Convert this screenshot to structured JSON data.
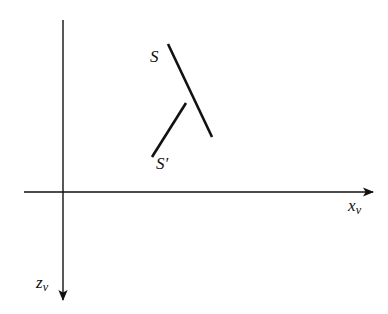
{
  "figure": {
    "background_color": "#ffffff",
    "stroke_color": "#111111",
    "width": 388,
    "height": 314
  },
  "axes": {
    "origin": {
      "x": 63,
      "y": 192
    },
    "horizontal": {
      "name": "x-axis",
      "label_text": "x",
      "label_subscript": "v",
      "start": {
        "x": 24,
        "y": 192
      },
      "end": {
        "x": 373,
        "y": 192
      },
      "arrow": "right",
      "stroke_width": 1.4
    },
    "vertical": {
      "name": "z-axis",
      "label_text": "z",
      "label_subscript": "v",
      "start": {
        "x": 63,
        "y": 20
      },
      "end": {
        "x": 63,
        "y": 300
      },
      "arrow": "down",
      "stroke_width": 1.4
    }
  },
  "segments": [
    {
      "name": "segment-S",
      "label_text": "S",
      "label_prime": "",
      "x1": 168,
      "y1": 44,
      "x2": 212,
      "y2": 137,
      "stroke_width": 2.6
    },
    {
      "name": "segment-S-prime",
      "label_text": "S",
      "label_prime": "′",
      "x1": 152,
      "y1": 157,
      "x2": 186,
      "y2": 103,
      "stroke_width": 2.6
    }
  ],
  "labels": {
    "s": "S",
    "s_prime": "S′",
    "x_axis": "x",
    "x_axis_sub": "v",
    "z_axis": "z",
    "z_axis_sub": "v"
  }
}
